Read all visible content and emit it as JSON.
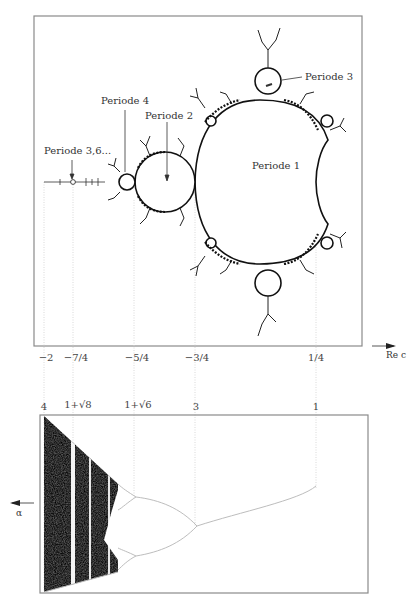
{
  "figure": {
    "top_panel": {
      "title": "Mandelbrot set",
      "labels": {
        "period1": "Periode 1",
        "period2": "Periode 2",
        "period3": "Periode 3",
        "period4": "Periode 4",
        "period36": "Periode 3,6..."
      },
      "axis_label": "Re c",
      "ticks": [
        {
          "label": "−2",
          "x": 44
        },
        {
          "label": "−7/4",
          "x": 73
        },
        {
          "label": "−5/4",
          "x": 134
        },
        {
          "label": "−3/4",
          "x": 195
        },
        {
          "label": "1/4",
          "x": 316
        }
      ]
    },
    "bottom_panel": {
      "title": "Bifurcation diagram",
      "axis_label": "α",
      "ticks": [
        {
          "label": "4",
          "x": 44
        },
        {
          "label": "1+√8",
          "x": 73
        },
        {
          "label": "1+√6",
          "x": 134
        },
        {
          "label": "3",
          "x": 195
        },
        {
          "label": "1",
          "x": 316
        }
      ]
    },
    "colors": {
      "frame": "#888888",
      "ink": "#1a1a1a",
      "guide": "#c8c8c8",
      "curve": "#bdbdbd"
    }
  }
}
